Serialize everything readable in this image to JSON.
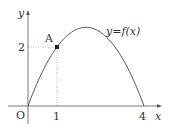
{
  "chart_data": {
    "type": "line",
    "title": "",
    "xlabel": "x",
    "ylabel": "y",
    "function_label": "y=f(x)",
    "function": "f(x) = -(2/3)x(x-4)",
    "x": [
      0,
      0.5,
      1,
      1.5,
      2,
      2.5,
      3,
      3.5,
      4
    ],
    "series": [
      {
        "name": "y=f(x)",
        "values": [
          0,
          1.1667,
          2,
          2.5,
          2.6667,
          2.5,
          2,
          1.1667,
          0
        ]
      }
    ],
    "xticks": [
      "1",
      "4"
    ],
    "yticks": [
      "2"
    ],
    "origin_label": "O",
    "points": [
      {
        "label": "A",
        "x": 1,
        "y": 2
      }
    ],
    "guides": [
      {
        "from": [
          1,
          0
        ],
        "to": [
          1,
          2
        ],
        "style": "dotted"
      },
      {
        "from": [
          0,
          2
        ],
        "to": [
          1,
          2
        ],
        "style": "dotted"
      }
    ],
    "xlim": [
      -0.9,
      4.9
    ],
    "ylim": [
      -0.7,
      3.4
    ],
    "grid": false,
    "legend": "none"
  },
  "labels": {
    "y_axis": "y",
    "x_axis": "x",
    "origin": "O",
    "ytick_2": "2",
    "xtick_1": "1",
    "xtick_4": "4",
    "point_A": "A",
    "curve": "y=f(x)"
  }
}
